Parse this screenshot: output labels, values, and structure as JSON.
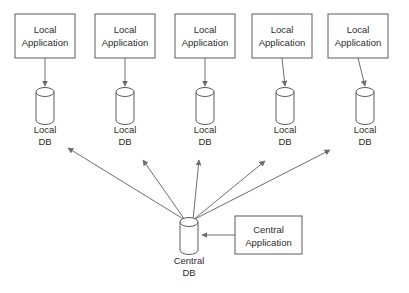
{
  "diagram": {
    "background_color": "#ffffff",
    "stroke_color": "#5a5a5a",
    "line_color": "#6e6e6e",
    "text_color": "#2b2b2b",
    "local_nodes": [
      {
        "app_label_line1": "Local",
        "app_label_line2": "Application",
        "db_label_line1": "Local",
        "db_label_line2": "DB",
        "box_x": 15,
        "box_y": 14,
        "box_w": 60,
        "box_h": 44,
        "cyl_cx": 45,
        "cyl_top_y": 92,
        "cyl_bottom_y": 120,
        "cyl_rx": 9,
        "cyl_ry": 4.5,
        "db_text_y1": 130,
        "db_text_y2": 142,
        "radial_tip_x": 68,
        "radial_tip_y": 148
      },
      {
        "app_label_line1": "Local",
        "app_label_line2": "Application",
        "db_label_line1": "Local",
        "db_label_line2": "DB",
        "box_x": 95,
        "box_y": 14,
        "box_w": 60,
        "box_h": 44,
        "cyl_cx": 125,
        "cyl_top_y": 92,
        "cyl_bottom_y": 120,
        "cyl_rx": 9,
        "cyl_ry": 4.5,
        "db_text_y1": 130,
        "db_text_y2": 142,
        "radial_tip_x": 143,
        "radial_tip_y": 160
      },
      {
        "app_label_line1": "Local",
        "app_label_line2": "Application",
        "db_label_line1": "Local",
        "db_label_line2": "DB",
        "box_x": 175,
        "box_y": 14,
        "box_w": 60,
        "box_h": 44,
        "cyl_cx": 205,
        "cyl_top_y": 92,
        "cyl_bottom_y": 120,
        "cyl_rx": 9,
        "cyl_ry": 4.5,
        "db_text_y1": 130,
        "db_text_y2": 142,
        "radial_tip_x": 199,
        "radial_tip_y": 160
      },
      {
        "app_label_line1": "Local",
        "app_label_line2": "Application",
        "db_label_line1": "Local",
        "db_label_line2": "DB",
        "box_x": 252,
        "box_y": 14,
        "box_w": 60,
        "box_h": 44,
        "cyl_cx": 285,
        "cyl_top_y": 92,
        "cyl_bottom_y": 120,
        "cyl_rx": 9,
        "cyl_ry": 4.5,
        "db_text_y1": 130,
        "db_text_y2": 142,
        "radial_tip_x": 265,
        "radial_tip_y": 161
      },
      {
        "app_label_line1": "Local",
        "app_label_line2": "Application",
        "db_label_line1": "Local",
        "db_label_line2": "DB",
        "box_x": 328,
        "box_y": 14,
        "box_w": 60,
        "box_h": 44,
        "cyl_cx": 365,
        "cyl_top_y": 92,
        "cyl_bottom_y": 120,
        "cyl_rx": 9,
        "cyl_ry": 4.5,
        "db_text_y1": 130,
        "db_text_y2": 142,
        "radial_tip_x": 330,
        "radial_tip_y": 150
      }
    ],
    "central_db": {
      "label_line1": "Central",
      "label_line2": "DB",
      "cyl_cx": 189,
      "cyl_top_y": 222,
      "cyl_bottom_y": 250,
      "cyl_rx": 9,
      "cyl_ry": 4.5,
      "text_y1": 261,
      "text_y2": 273
    },
    "central_app": {
      "label_line1": "Central",
      "label_line2": "Application",
      "box_x": 235,
      "box_y": 216,
      "box_w": 67,
      "box_h": 38
    },
    "arrows": {
      "app_to_db_note": "vertical arrow from each Local Application box down to its Local DB cylinder",
      "central_to_locals_note": "arrows radiating from Central DB up to each Local DB",
      "app_to_central_note": "arrow from Central Application left into Central DB"
    }
  }
}
